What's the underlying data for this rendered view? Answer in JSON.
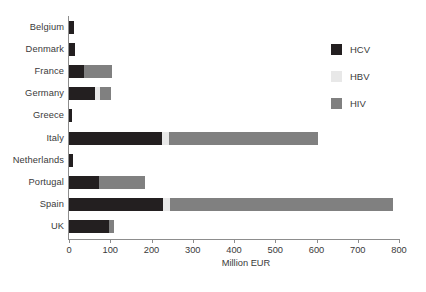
{
  "chart_data": {
    "type": "bar",
    "orientation": "horizontal",
    "stacked": true,
    "title": "",
    "xlabel": "Million EUR",
    "ylabel": "",
    "xlim": [
      0,
      800
    ],
    "xticks": [
      0,
      100,
      200,
      300,
      400,
      500,
      600,
      700,
      800
    ],
    "xtick_labels": [
      "0",
      "100",
      "200",
      "300",
      "400",
      "500",
      "600",
      "700",
      "800"
    ],
    "grid": false,
    "legend_position": "upper right",
    "categories": [
      "Belgium",
      "Denmark",
      "France",
      "Germany",
      "Greece",
      "Italy",
      "Netherlands",
      "Portugal",
      "Spain",
      "UK"
    ],
    "series": [
      {
        "name": "HCV",
        "color": "#231f20",
        "values": [
          13,
          14,
          37,
          64,
          8,
          225,
          10,
          73,
          227,
          98
        ]
      },
      {
        "name": "HBV",
        "color": "#e8e8e8",
        "values": [
          0,
          0,
          0,
          10,
          0,
          17,
          0,
          0,
          17,
          0
        ]
      },
      {
        "name": "HIV",
        "color": "#808080",
        "values": [
          0,
          0,
          68,
          28,
          0,
          362,
          0,
          112,
          541,
          10
        ]
      }
    ],
    "totals": [
      13,
      14,
      105,
      102,
      8,
      604,
      10,
      185,
      785,
      108
    ]
  },
  "legend": {
    "items": [
      {
        "label": "HCV",
        "color": "#231f20",
        "swatch": "legend-swatch-hcv"
      },
      {
        "label": "HBV",
        "color": "#e8e8e8",
        "swatch": "legend-swatch-hbv"
      },
      {
        "label": "HIV",
        "color": "#808080",
        "swatch": "legend-swatch-hiv"
      }
    ]
  },
  "axis": {
    "x_title": "Million EUR"
  }
}
